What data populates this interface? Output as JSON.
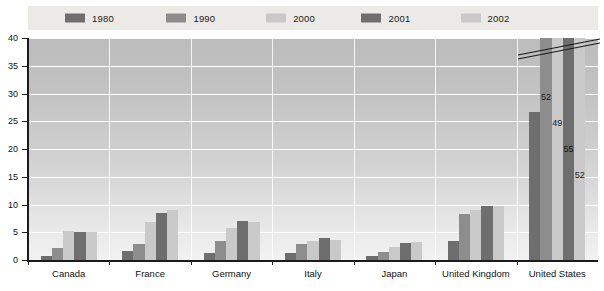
{
  "chart_data": {
    "type": "bar",
    "title": "",
    "subtitle": "",
    "xlabel": "",
    "ylabel": "",
    "ylim": [
      0,
      40
    ],
    "yticks": [
      0,
      5,
      10,
      15,
      20,
      25,
      30,
      35,
      40
    ],
    "grid": true,
    "legend_position": "top",
    "axis_break": true,
    "axis_break_note": "United States bars for 1990, 2000, 2001 and 2002 exceed the 40 axis maximum and are truncated with a diagonal break mark; their values are printed on the bars.",
    "categories": [
      "Canada",
      "France",
      "Germany",
      "Italy",
      "Japan",
      "United Kingdom",
      "United States"
    ],
    "series": [
      {
        "name": "1980",
        "color": "#6e6e6e",
        "values": [
          0.8,
          1.7,
          1.3,
          1.2,
          0.7,
          3.4,
          26.6
        ],
        "labels": [
          "",
          "",
          "",
          "",
          "",
          "",
          ""
        ]
      },
      {
        "name": "1990",
        "color": "#8d8d8d",
        "values": [
          2.2,
          2.9,
          3.5,
          2.8,
          1.4,
          8.3,
          52
        ],
        "labels": [
          "",
          "",
          "",
          "",
          "",
          "",
          "52"
        ]
      },
      {
        "name": "2000",
        "color": "#c9c9c9",
        "values": [
          5.2,
          6.9,
          5.7,
          3.4,
          2.3,
          9.0,
          49
        ],
        "labels": [
          "",
          "",
          "",
          "",
          "",
          "",
          "49"
        ]
      },
      {
        "name": "2001",
        "color": "#6e6e6e",
        "values": [
          5.1,
          8.5,
          7.0,
          4.0,
          3.1,
          9.7,
          55
        ],
        "labels": [
          "",
          "",
          "",
          "",
          "",
          "",
          "55"
        ]
      },
      {
        "name": "2002",
        "color": "#c9c9c9",
        "values": [
          5.1,
          9.1,
          6.9,
          3.6,
          3.3,
          9.7,
          52
        ],
        "labels": [
          "",
          "",
          "",
          "",
          "",
          "",
          "52"
        ]
      }
    ]
  },
  "legend": {
    "items": [
      {
        "label": "1980",
        "color": "#6e6e6e"
      },
      {
        "label": "1990",
        "color": "#8d8d8d"
      },
      {
        "label": "2000",
        "color": "#c9c9c9"
      },
      {
        "label": "2001",
        "color": "#6e6e6e"
      },
      {
        "label": "2002",
        "color": "#c9c9c9"
      }
    ]
  },
  "colors": {
    "legend_background": "#eceae6",
    "plot_top": "#bcbcbc",
    "plot_bottom": "#f2f2f2",
    "gridline": "#ffffff",
    "axis": "#1b1b1b",
    "text": "#111111"
  }
}
